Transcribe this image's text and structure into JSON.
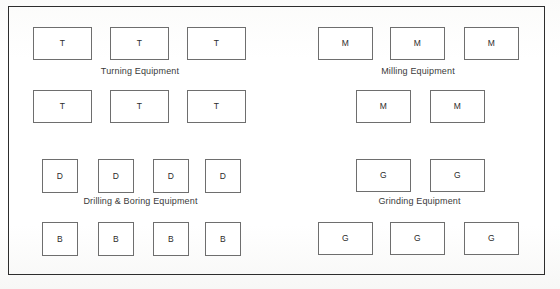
{
  "diagram": {
    "background_color": "#fdfdfc",
    "frame_color": "#2d2d2d",
    "box_border_color": "#6e6e6e",
    "text_color": "#2b2b2b"
  },
  "zones": [
    {
      "id": "turning",
      "label": "Turning Equipment",
      "label_left": 85,
      "label_top": 66,
      "label_width": 110,
      "machines": [
        {
          "code": "T",
          "left": 33,
          "top": 27,
          "width": 59,
          "height": 33
        },
        {
          "code": "T",
          "left": 110,
          "top": 27,
          "width": 59,
          "height": 33
        },
        {
          "code": "T",
          "left": 187,
          "top": 27,
          "width": 59,
          "height": 33
        },
        {
          "code": "T",
          "left": 33,
          "top": 90,
          "width": 59,
          "height": 33
        },
        {
          "code": "T",
          "left": 110,
          "top": 90,
          "width": 59,
          "height": 33
        },
        {
          "code": "T",
          "left": 187,
          "top": 90,
          "width": 59,
          "height": 33
        }
      ]
    },
    {
      "id": "milling",
      "label": "Milling Equipment",
      "label_left": 363,
      "label_top": 66,
      "label_width": 110,
      "machines": [
        {
          "code": "M",
          "left": 318,
          "top": 27,
          "width": 55,
          "height": 33
        },
        {
          "code": "M",
          "left": 390,
          "top": 27,
          "width": 55,
          "height": 33
        },
        {
          "code": "M",
          "left": 464,
          "top": 27,
          "width": 55,
          "height": 33
        },
        {
          "code": "M",
          "left": 356,
          "top": 90,
          "width": 55,
          "height": 33
        },
        {
          "code": "M",
          "left": 430,
          "top": 90,
          "width": 55,
          "height": 33
        }
      ]
    },
    {
      "id": "drilling-boring",
      "label": "Drilling & Boring Equipment",
      "label_left": 58,
      "label_top": 196,
      "label_width": 165,
      "machines": [
        {
          "code": "D",
          "left": 42,
          "top": 159,
          "width": 36,
          "height": 34
        },
        {
          "code": "D",
          "left": 98,
          "top": 159,
          "width": 36,
          "height": 34
        },
        {
          "code": "D",
          "left": 153,
          "top": 159,
          "width": 36,
          "height": 34
        },
        {
          "code": "D",
          "left": 205,
          "top": 159,
          "width": 36,
          "height": 34
        },
        {
          "code": "B",
          "left": 42,
          "top": 222,
          "width": 36,
          "height": 34
        },
        {
          "code": "B",
          "left": 98,
          "top": 222,
          "width": 36,
          "height": 34
        },
        {
          "code": "B",
          "left": 153,
          "top": 222,
          "width": 36,
          "height": 34
        },
        {
          "code": "B",
          "left": 205,
          "top": 222,
          "width": 36,
          "height": 34
        }
      ]
    },
    {
      "id": "grinding",
      "label": "Grinding Equipment",
      "label_left": 362,
      "label_top": 196,
      "label_width": 115,
      "machines": [
        {
          "code": "G",
          "left": 356,
          "top": 159,
          "width": 55,
          "height": 33
        },
        {
          "code": "G",
          "left": 430,
          "top": 159,
          "width": 55,
          "height": 33
        },
        {
          "code": "G",
          "left": 318,
          "top": 222,
          "width": 55,
          "height": 33
        },
        {
          "code": "G",
          "left": 390,
          "top": 222,
          "width": 55,
          "height": 33
        },
        {
          "code": "G",
          "left": 464,
          "top": 222,
          "width": 55,
          "height": 33
        }
      ]
    }
  ]
}
